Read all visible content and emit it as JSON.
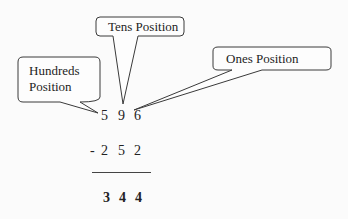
{
  "callouts": {
    "hundreds": {
      "line1": "Hundreds",
      "line2": "Position"
    },
    "tens": {
      "label": "Tens Position"
    },
    "ones": {
      "label": "Ones Position"
    }
  },
  "problem": {
    "minuend": [
      "5",
      "9",
      "6"
    ],
    "operator": "-",
    "subtrahend": [
      "2",
      "5",
      "2"
    ],
    "result": [
      "3",
      "4",
      "4"
    ]
  }
}
